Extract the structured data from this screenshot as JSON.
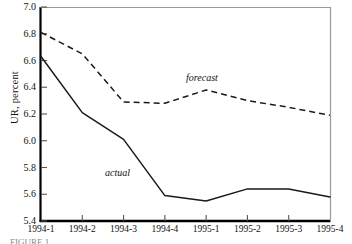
{
  "figure": {
    "caption_partial": "FIGURE 1"
  },
  "axes": {
    "y_title": "UR, percent",
    "y_ticks": [
      "7.0",
      "6.8",
      "6.6",
      "6.4",
      "6.2",
      "6.0",
      "5.8",
      "5.6",
      "5.4"
    ],
    "x_ticks": [
      "1994-1",
      "1994-2",
      "1994-3",
      "1994-4",
      "1995-1",
      "1995-2",
      "1995-3",
      "1995-4"
    ]
  },
  "annotations": {
    "forecast": "forecast",
    "actual": "actual"
  },
  "colors": {
    "line": "#1a1a1a",
    "axis": "#000000",
    "background": "#ffffff"
  },
  "chart_data": {
    "type": "line",
    "title": "",
    "xlabel": "",
    "ylabel": "UR, percent",
    "categories": [
      "1994-1",
      "1994-2",
      "1994-3",
      "1994-4",
      "1995-1",
      "1995-2",
      "1995-3",
      "1995-4"
    ],
    "ylim": [
      5.4,
      7.0
    ],
    "ytick_step": 0.2,
    "grid": false,
    "legend": "inline-annotations",
    "series": [
      {
        "name": "actual",
        "style": "solid",
        "values": [
          6.63,
          6.21,
          6.01,
          5.59,
          5.55,
          5.64,
          5.64,
          5.58
        ]
      },
      {
        "name": "forecast",
        "style": "dashed",
        "values": [
          6.81,
          6.65,
          6.29,
          6.28,
          6.38,
          6.3,
          6.25,
          6.19
        ]
      }
    ]
  }
}
